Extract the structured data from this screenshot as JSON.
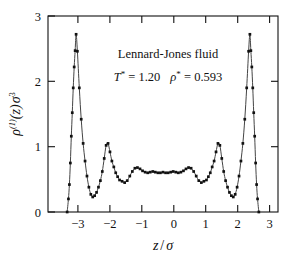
{
  "chart_data": {
    "type": "line",
    "title": "",
    "xlabel": "z / σ",
    "ylabel": "ρ⁽¹⁾(z)σ³",
    "xlim": [
      -3.6,
      3.6
    ],
    "ylim": [
      0,
      3
    ],
    "xticks": [
      -3,
      -2,
      -1,
      0,
      1,
      2,
      3
    ],
    "xtick_labels": [
      "−3",
      "−2",
      "−1",
      "0",
      "1",
      "2",
      "3"
    ],
    "yticks": [
      0,
      1,
      2,
      3
    ],
    "ytick_labels": [
      "0",
      "1",
      "2",
      "3"
    ],
    "grid": false,
    "legend": "none",
    "marker": "square",
    "series": [
      {
        "name": "density profile",
        "x": [
          -3.0,
          -2.96,
          -2.93,
          -2.9,
          -2.87,
          -2.84,
          -2.81,
          -2.78,
          -2.75,
          -2.72,
          -2.68,
          -2.62,
          -2.56,
          -2.5,
          -2.44,
          -2.38,
          -2.32,
          -2.26,
          -2.2,
          -2.14,
          -2.08,
          -2.02,
          -1.96,
          -1.9,
          -1.84,
          -1.78,
          -1.72,
          -1.66,
          -1.6,
          -1.54,
          -1.48,
          -1.42,
          -1.36,
          -1.28,
          -1.2,
          -1.12,
          -1.04,
          -0.96,
          -0.88,
          -0.8,
          -0.72,
          -0.64,
          -0.56,
          -0.48,
          -0.4,
          -0.32,
          -0.24,
          -0.16,
          -0.08,
          0.0,
          0.08,
          0.16,
          0.24,
          0.32,
          0.4,
          0.48,
          0.56,
          0.64,
          0.72,
          0.8,
          0.88,
          0.96,
          1.04,
          1.12,
          1.2,
          1.28,
          1.36,
          1.42,
          1.48,
          1.54,
          1.6,
          1.66,
          1.72,
          1.78,
          1.84,
          1.9,
          1.96,
          2.02,
          2.08,
          2.14,
          2.2,
          2.26,
          2.32,
          2.38,
          2.44,
          2.5,
          2.56,
          2.62,
          2.68,
          2.72,
          2.75,
          2.78,
          2.81,
          2.84,
          2.87,
          2.9,
          2.93,
          2.96,
          3.0
        ],
        "y": [
          0.0,
          0.2,
          0.42,
          0.75,
          1.16,
          1.52,
          1.9,
          2.22,
          2.47,
          2.72,
          2.46,
          1.9,
          1.42,
          1.05,
          0.78,
          0.55,
          0.38,
          0.27,
          0.23,
          0.25,
          0.3,
          0.38,
          0.48,
          0.62,
          0.82,
          1.02,
          1.05,
          0.92,
          0.78,
          0.69,
          0.6,
          0.54,
          0.49,
          0.47,
          0.45,
          0.48,
          0.55,
          0.62,
          0.67,
          0.68,
          0.66,
          0.63,
          0.61,
          0.6,
          0.61,
          0.62,
          0.61,
          0.6,
          0.6,
          0.61,
          0.6,
          0.6,
          0.61,
          0.62,
          0.61,
          0.6,
          0.61,
          0.63,
          0.66,
          0.68,
          0.67,
          0.62,
          0.55,
          0.48,
          0.45,
          0.47,
          0.49,
          0.54,
          0.6,
          0.69,
          0.78,
          0.92,
          1.05,
          1.02,
          0.82,
          0.62,
          0.48,
          0.38,
          0.3,
          0.25,
          0.23,
          0.27,
          0.38,
          0.55,
          0.78,
          1.05,
          1.42,
          1.9,
          2.46,
          2.72,
          2.47,
          2.22,
          1.9,
          1.52,
          1.16,
          0.75,
          0.42,
          0.2,
          0.0
        ]
      }
    ],
    "annotations": [
      {
        "id": "system-label",
        "text": "Lennard-Jones fluid",
        "x": 0.15,
        "y": 2.37
      },
      {
        "id": "state-point",
        "text": "T* = 1.20   ρ* = 0.593",
        "x": 0.15,
        "y": 2.02
      }
    ],
    "features": {
      "wall_peak_height": 2.72,
      "wall_peak_position": 2.72,
      "secondary_peak_height": 1.05,
      "secondary_peak_position": 1.78,
      "first_minimum": 0.23,
      "first_minimum_position": 2.2,
      "bulk_density": 0.61
    }
  },
  "annotation_parts": {
    "system": "Lennard-Jones fluid",
    "temperature_symbol": "T",
    "temperature_star": "*",
    "temperature_eq": " = 1.20",
    "density_symbol": "ρ",
    "density_star": "*",
    "density_eq": " = 0.593"
  },
  "axis_labels": {
    "x_numerator": "z",
    "x_slash": "/",
    "x_denominator": "σ",
    "y_rho": "ρ",
    "y_superscript_one": "(1)",
    "y_of_z": "(z)",
    "y_sigma": "σ",
    "y_sigma_power": "3"
  }
}
